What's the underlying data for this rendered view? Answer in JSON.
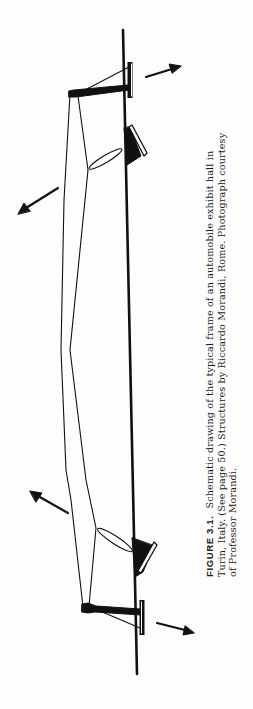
{
  "figure": {
    "label": "FIGURE 3.1.",
    "caption_lines": [
      "Schematic drawing of the typical frame of an automobile exhibit hall in",
      "Turin, Italy. (See page 50.) Structures by Riccardo Morandi, Rome. Photograph courtesy",
      "of Professor Morandi."
    ],
    "drawing": {
      "subject": "schematic-frame-automobile-exhibit-hall",
      "ink_color": "#111111",
      "paper_color": "#fdfdfd",
      "arrows": [
        "arrow-top-right",
        "arrow-top-left",
        "arrow-bottom-left",
        "arrow-bottom-right"
      ]
    }
  }
}
